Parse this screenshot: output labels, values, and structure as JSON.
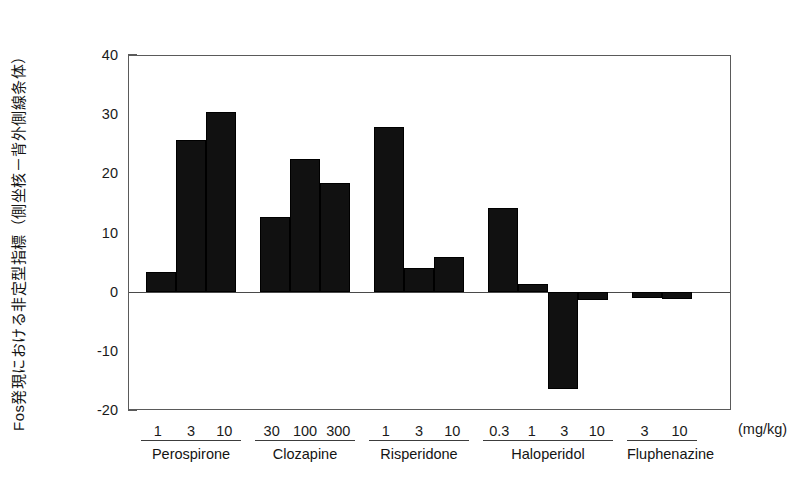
{
  "chart_data": {
    "type": "bar",
    "title": "",
    "ylabel": "Fos発現における非定型指標（側坐核－背外側線条体）",
    "xlabel": "",
    "unit_label": "(mg/kg)",
    "ylim": [
      -20,
      40
    ],
    "ytick_labels": [
      "40",
      "30",
      "20",
      "10",
      "0",
      "-10",
      "-20"
    ],
    "ytick_values": [
      40,
      30,
      20,
      10,
      0,
      -10,
      -20
    ],
    "yminor_step": 5,
    "grid": false,
    "legend": false,
    "zero_line": true,
    "groups": [
      {
        "name": "Perospirone",
        "doses": [
          "1",
          "3",
          "10"
        ],
        "values": [
          3.4,
          25.7,
          30.4
        ]
      },
      {
        "name": "Clozapine",
        "doses": [
          "30",
          "100",
          "300"
        ],
        "values": [
          12.6,
          22.4,
          18.4
        ]
      },
      {
        "name": "Risperidone",
        "doses": [
          "1",
          "3",
          "10"
        ],
        "values": [
          27.9,
          4.0,
          5.8
        ]
      },
      {
        "name": "Haloperidol",
        "doses": [
          "0.3",
          "1",
          "3",
          "10"
        ],
        "values": [
          14.2,
          1.3,
          -16.5,
          -1.4
        ]
      },
      {
        "name": "Fluphenazine",
        "doses": [
          "3",
          "10"
        ],
        "values": [
          -1.1,
          -1.2
        ]
      }
    ],
    "colors": {
      "bar": "#111111",
      "axis": "#5a5a5a",
      "text": "#1a1a1a"
    }
  }
}
